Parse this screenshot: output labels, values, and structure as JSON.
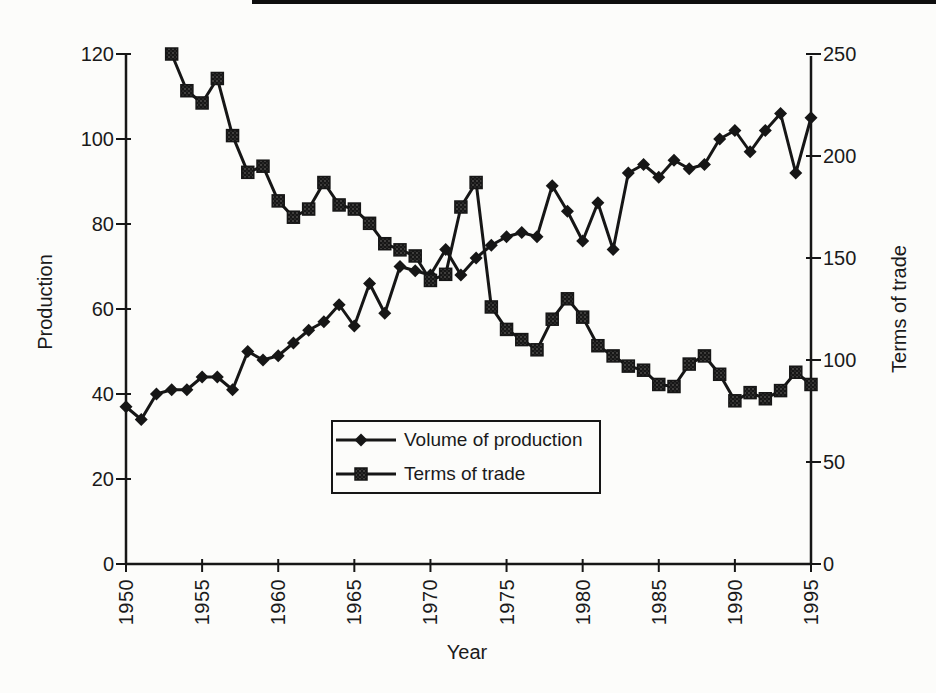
{
  "page": {
    "background": "#fcfcfa",
    "ink": "#161616",
    "top_rule_present": true
  },
  "chart_data": {
    "type": "line",
    "title": "",
    "xlabel": "Year",
    "x_range": [
      1950,
      1995
    ],
    "x_ticks": [
      1950,
      1955,
      1960,
      1965,
      1970,
      1975,
      1980,
      1985,
      1990,
      1995
    ],
    "left_axis": {
      "label": "Production",
      "min": 0,
      "max": 120,
      "ticks": [
        0,
        20,
        40,
        60,
        80,
        100,
        120
      ]
    },
    "right_axis": {
      "label": "Terms of trade",
      "min": 0,
      "max": 250,
      "ticks": [
        0,
        50,
        100,
        150,
        200,
        250
      ]
    },
    "grid": false,
    "legend": {
      "position": "inside-bottom-center",
      "entries": [
        {
          "label": "Volume of production",
          "marker": "diamond"
        },
        {
          "label": "Terms of trade",
          "marker": "square"
        }
      ]
    },
    "series": [
      {
        "name": "Volume of production",
        "axis": "left",
        "marker": "diamond",
        "start_year": 1950,
        "values": [
          37,
          34,
          40,
          41,
          41,
          44,
          44,
          41,
          50,
          48,
          49,
          52,
          55,
          57,
          61,
          56,
          66,
          59,
          70,
          69,
          68,
          74,
          68,
          72,
          75,
          77,
          78,
          77,
          89,
          83,
          76,
          85,
          74,
          92,
          94,
          91,
          95,
          93,
          94,
          100,
          102,
          97,
          102,
          106,
          92,
          105
        ]
      },
      {
        "name": "Terms of trade",
        "axis": "right",
        "marker": "square",
        "start_year": 1953,
        "values": [
          250,
          232,
          226,
          238,
          210,
          192,
          195,
          178,
          170,
          174,
          187,
          176,
          174,
          167,
          157,
          154,
          151,
          139,
          142,
          175,
          187,
          126,
          115,
          110,
          105,
          120,
          130,
          121,
          107,
          102,
          97,
          95,
          88,
          87,
          98,
          102,
          93,
          80,
          84,
          81,
          85,
          94,
          88
        ]
      }
    ]
  }
}
